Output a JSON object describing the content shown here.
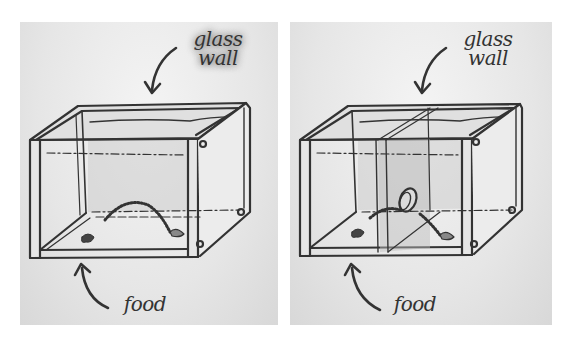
{
  "figure": {
    "panels": [
      {
        "id": "left",
        "description": "glass tank with mouse path to food, no partition",
        "labels": {
          "top": [
            "glass",
            "wall"
          ],
          "bottom": "food"
        },
        "top_label_blurred": true,
        "has_partition": false
      },
      {
        "id": "right",
        "description": "glass tank with partition wall containing hole, mouse path through hole to food",
        "labels": {
          "top": [
            "glass",
            "wall"
          ],
          "bottom": "food"
        },
        "top_label_blurred": false,
        "has_partition": true
      }
    ],
    "colors": {
      "ink": "#333333",
      "glass": "#d9d9d9",
      "background": "#ffffff"
    }
  }
}
